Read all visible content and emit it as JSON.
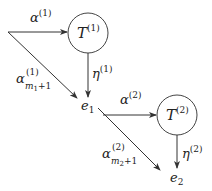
{
  "diagram": {
    "nodes": [
      {
        "id": "T1",
        "label": "T",
        "superscript": "(1)"
      },
      {
        "id": "T2",
        "label": "T",
        "superscript": "(2)"
      },
      {
        "id": "e1",
        "label": "e",
        "subscript": "1"
      },
      {
        "id": "e2",
        "label": "e",
        "subscript": "2"
      }
    ],
    "edges": [
      {
        "from": "start",
        "to": "T1",
        "label": "α",
        "superscript": "(1)"
      },
      {
        "from": "start",
        "to": "e1",
        "label": "α",
        "superscript": "(1)",
        "subscript": "m",
        "subsub": "1",
        "subtail": "+1"
      },
      {
        "from": "T1",
        "to": "e1",
        "label": "η",
        "superscript": "(1)"
      },
      {
        "from": "e1",
        "to": "T2",
        "label": "α",
        "superscript": "(2)"
      },
      {
        "from": "e1",
        "to": "e2",
        "label": "α",
        "superscript": "(2)",
        "subscript": "m",
        "subsub": "2",
        "subtail": "+1"
      },
      {
        "from": "T2",
        "to": "e2",
        "label": "η",
        "superscript": "(2)"
      }
    ]
  }
}
